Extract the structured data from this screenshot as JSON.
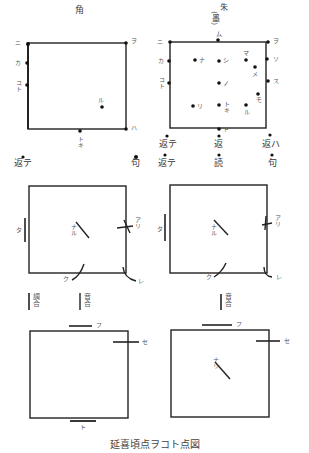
{
  "headers": {
    "left": "角",
    "right": "朱",
    "right_sub": "(墨)"
  },
  "diagram1_left": {
    "corners": {
      "top_left": "ニ",
      "top_right": "ヲ",
      "bottom_right": "ハ"
    },
    "left_edge": [
      "カ",
      "コト"
    ],
    "interior": [
      "ル"
    ],
    "bottom_edge": "トキ",
    "below": {
      "left": "返テ",
      "right": "句"
    }
  },
  "diagram1_right": {
    "corners": {
      "top_left": "ニ",
      "top_right": "ヲ"
    },
    "top_edge": "ム",
    "left_edge": [
      "カ",
      "コト"
    ],
    "right_edge": [
      "ソ",
      "ス"
    ],
    "interior": [
      "ナ",
      "シ",
      "マ",
      "メ",
      "ノ",
      "モ",
      "リ",
      "トキ",
      "ル"
    ],
    "bottom_edge": "ト",
    "below_row1": {
      "left": "返テ",
      "center": "返",
      "right": "返ハ"
    },
    "below_row2": {
      "left": "返テ",
      "center": "読",
      "right": "句"
    }
  },
  "diagram2_left": {
    "left": "タ",
    "center": "ナル",
    "right": "アリ",
    "bottom": "ク",
    "bottom_right": "レ",
    "notes": [
      "調合",
      "音合"
    ]
  },
  "diagram2_right": {
    "left": "タ",
    "center": "ナル",
    "right": "アリ",
    "bottom": "ク",
    "bottom_right": "レ",
    "notes": [
      "音合"
    ]
  },
  "diagram3_left": {
    "top": "フ",
    "right": "セ",
    "bottom": "ト"
  },
  "diagram3_right": {
    "top": "フ",
    "right": "セ",
    "center": "ナリ"
  },
  "caption": "延喜頃点ヲコト点図"
}
